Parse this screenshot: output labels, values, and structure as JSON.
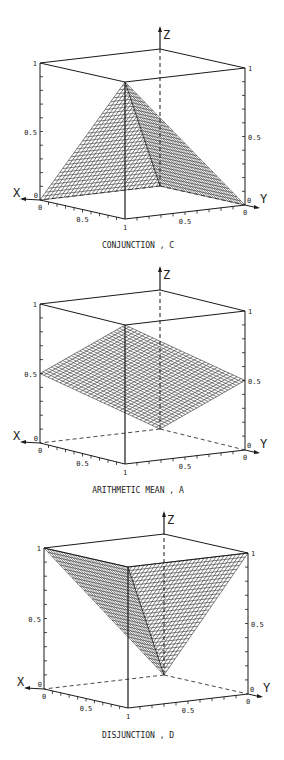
{
  "chart_data": [
    {
      "type": "surface3d",
      "title": "CONJUNCTION , C",
      "function": "min(x,y)",
      "xlabel": "X",
      "ylabel": "Y",
      "zlabel": "Z",
      "x_ticks": [
        "0",
        "0.5",
        "1"
      ],
      "y_ticks": [
        "0",
        "0.5",
        "1"
      ],
      "z_ticks": [
        "0",
        "0.5",
        "1"
      ],
      "xlim": [
        0,
        1
      ],
      "ylim": [
        0,
        1
      ],
      "zlim": [
        0,
        1
      ],
      "corner_values": {
        "x0_y0": 0,
        "x1_y0": 0,
        "x0_y1": 0,
        "x1_y1": 1
      },
      "grid": false
    },
    {
      "type": "surface3d",
      "title": "ARITHMETIC MEAN , A",
      "function": "(x+y)/2",
      "xlabel": "X",
      "ylabel": "Y",
      "zlabel": "Z",
      "x_ticks": [
        "0",
        "0.5",
        "1"
      ],
      "y_ticks": [
        "0",
        "0.5",
        "1"
      ],
      "z_ticks": [
        "0",
        "0.5",
        "1"
      ],
      "xlim": [
        0,
        1
      ],
      "ylim": [
        0,
        1
      ],
      "zlim": [
        0,
        1
      ],
      "corner_values": {
        "x0_y0": 0,
        "x1_y0": 0.5,
        "x0_y1": 0.5,
        "x1_y1": 1
      },
      "grid": false
    },
    {
      "type": "surface3d",
      "title": "DISJUNCTION , D",
      "function": "max(x,y)",
      "xlabel": "X",
      "ylabel": "Y",
      "zlabel": "Z",
      "x_ticks": [
        "0",
        "0.5",
        "1"
      ],
      "y_ticks": [
        "0",
        "0.5",
        "1"
      ],
      "z_ticks": [
        "0",
        "0.5",
        "1"
      ],
      "xlim": [
        0,
        1
      ],
      "ylim": [
        0,
        1
      ],
      "zlim": [
        0,
        1
      ],
      "corner_values": {
        "x0_y0": 0,
        "x1_y0": 1,
        "x0_y1": 1,
        "x1_y1": 1
      },
      "grid": false
    }
  ],
  "layout": {
    "plots": [
      {
        "B": [
          160,
          186
        ],
        "L": [
          40,
          200
        ],
        "R": [
          245,
          205
        ],
        "h": 137,
        "zTop": 28,
        "labelY": 248
      },
      {
        "B": [
          160,
          429
        ],
        "L": [
          40,
          443
        ],
        "R": [
          245,
          450
        ],
        "h": 139,
        "zTop": 268,
        "labelY": 493
      },
      {
        "B": [
          164,
          675
        ],
        "L": [
          44,
          689
        ],
        "R": [
          248,
          694
        ],
        "h": 141,
        "zTop": 513,
        "labelY": 738
      }
    ],
    "mesh_steps": 30,
    "colors": {
      "line": "#1a1a1a",
      "mesh": "#2a2a2a",
      "background": "#ffffff"
    }
  }
}
